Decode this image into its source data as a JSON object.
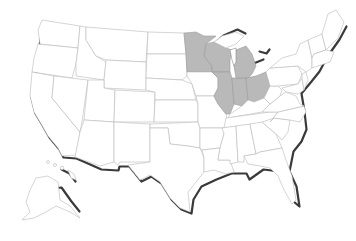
{
  "map": {
    "type": "US states choropleth",
    "fill_color_default": "#ffffff",
    "fill_color_highlight": "#b9b9b9",
    "border_color": "#b8b8b8",
    "coast_shadow_color": "#3a3a3a",
    "highlighted_states": [
      "Minnesota",
      "Wisconsin",
      "Michigan (Lower Peninsula)",
      "Illinois",
      "Indiana",
      "Ohio"
    ],
    "insets": [
      "Alaska",
      "Hawaii"
    ]
  }
}
